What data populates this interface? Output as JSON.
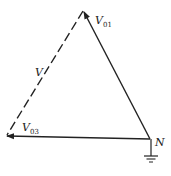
{
  "diagram": {
    "type": "phasor-triangle",
    "colors": {
      "stroke": "#222222",
      "background": "#ffffff"
    },
    "nodes": {
      "neutral": {
        "label": "N"
      }
    },
    "phasors": [
      {
        "name": "V01",
        "base": "V",
        "sub": "01",
        "style": "solid",
        "from": "N",
        "to": "top"
      },
      {
        "name": "V03",
        "base": "V",
        "sub": "03",
        "style": "solid",
        "from": "N",
        "to": "bottom-left"
      },
      {
        "name": "V",
        "base": "V",
        "sub": "",
        "style": "dashed",
        "from": "top",
        "to": "bottom-left"
      }
    ],
    "ground_symbol": true
  }
}
